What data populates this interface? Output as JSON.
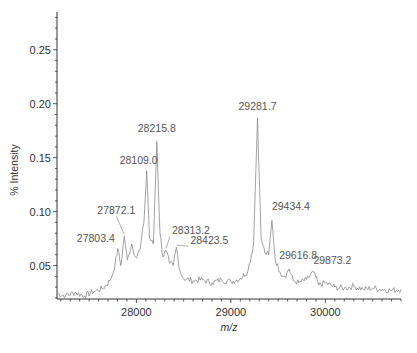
{
  "chart_data": {
    "type": "line",
    "title": "",
    "xlabel": "m/z",
    "ylabel": "% Intensity",
    "xlim": [
      27160,
      30800
    ],
    "ylim": [
      0.019,
      0.285
    ],
    "grid": false,
    "legend": null,
    "x_ticks": [
      28000,
      29000,
      30000
    ],
    "x_tick_labels": [
      "28000",
      "29000",
      "30000"
    ],
    "y_ticks": [
      0.05,
      0.1,
      0.15,
      0.2,
      0.25
    ],
    "y_tick_labels": [
      "0.05",
      "0.10",
      "0.15",
      "0.20",
      "0.25"
    ],
    "peaks": [
      {
        "mz": 27803.4,
        "intensity": 0.066,
        "label": "27803.4"
      },
      {
        "mz": 27872.1,
        "intensity": 0.077,
        "label": "27872.1"
      },
      {
        "mz": 27950.0,
        "intensity": 0.07,
        "label": ""
      },
      {
        "mz": 28109.0,
        "intensity": 0.138,
        "label": "28109.0"
      },
      {
        "mz": 28215.8,
        "intensity": 0.165,
        "label": "28215.8"
      },
      {
        "mz": 28313.2,
        "intensity": 0.064,
        "label": "28313.2"
      },
      {
        "mz": 28423.5,
        "intensity": 0.067,
        "label": "28423.5"
      },
      {
        "mz": 29281.7,
        "intensity": 0.187,
        "label": "29281.7"
      },
      {
        "mz": 29434.4,
        "intensity": 0.092,
        "label": "29434.4"
      },
      {
        "mz": 29616.8,
        "intensity": 0.047,
        "label": "29616.8"
      },
      {
        "mz": 29873.2,
        "intensity": 0.044,
        "label": "29873.2"
      }
    ],
    "series": [
      {
        "name": "spectrum",
        "x": [
          27160,
          27250,
          27350,
          27450,
          27550,
          27650,
          27720,
          27760,
          27803.4,
          27835,
          27872.1,
          27905,
          27950,
          27990,
          28040,
          28080,
          28109.0,
          28140,
          28180,
          28215.8,
          28250,
          28280,
          28313.2,
          28350,
          28390,
          28423.5,
          28460,
          28500,
          28600,
          28700,
          28800,
          28900,
          29000,
          29100,
          29180,
          29240,
          29281.7,
          29320,
          29360,
          29400,
          29434.4,
          29470,
          29520,
          29570,
          29616.8,
          29660,
          29720,
          29800,
          29873.2,
          29930,
          30000,
          30100,
          30200,
          30300,
          30400,
          30500,
          30600,
          30700,
          30800
        ],
        "y": [
          0.024,
          0.022,
          0.025,
          0.022,
          0.026,
          0.029,
          0.036,
          0.045,
          0.066,
          0.05,
          0.077,
          0.055,
          0.07,
          0.058,
          0.065,
          0.09,
          0.138,
          0.075,
          0.07,
          0.165,
          0.08,
          0.058,
          0.064,
          0.052,
          0.05,
          0.067,
          0.045,
          0.038,
          0.036,
          0.037,
          0.034,
          0.037,
          0.035,
          0.038,
          0.045,
          0.07,
          0.187,
          0.075,
          0.062,
          0.06,
          0.092,
          0.055,
          0.044,
          0.04,
          0.047,
          0.036,
          0.034,
          0.037,
          0.044,
          0.032,
          0.034,
          0.03,
          0.029,
          0.031,
          0.028,
          0.029,
          0.028,
          0.027,
          0.028
        ]
      }
    ]
  }
}
